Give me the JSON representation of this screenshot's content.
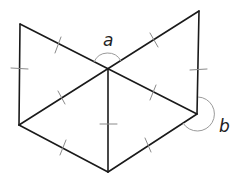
{
  "diagram": {
    "type": "geometry-figure",
    "vertices": {
      "TL": [
        20,
        24
      ],
      "C": [
        108,
        69
      ],
      "TR": [
        199,
        11
      ],
      "R": [
        197,
        114
      ],
      "B": [
        108,
        172
      ],
      "L": [
        19,
        125
      ]
    },
    "edges": [
      [
        "TL",
        "C"
      ],
      [
        "C",
        "R"
      ],
      [
        "L",
        "C"
      ],
      [
        "C",
        "TR"
      ],
      [
        "TL",
        "L"
      ],
      [
        "TR",
        "R"
      ],
      [
        "C",
        "B"
      ],
      [
        "L",
        "B"
      ],
      [
        "B",
        "R"
      ]
    ],
    "equal_length_marks": 10,
    "angles": [
      {
        "label": "a",
        "vertex": "C",
        "between": [
          "TL",
          "TR"
        ],
        "label_pos": [
          103,
          45
        ]
      },
      {
        "label": "b",
        "vertex": "R",
        "reflex": true,
        "label_pos": [
          220,
          131
        ]
      }
    ]
  },
  "labels": {
    "angle_a": "a",
    "angle_b": "b"
  }
}
